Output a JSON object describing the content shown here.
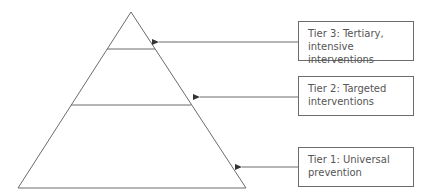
{
  "diagram": {
    "type": "pyramid",
    "line_color": "#6b6b6b",
    "tiers": [
      {
        "id": "tier3",
        "label_line1": "Tier 3: Tertiary,",
        "label_line2": "intensive interventions"
      },
      {
        "id": "tier2",
        "label_line1": "Tier 2: Targeted",
        "label_line2": "interventions"
      },
      {
        "id": "tier1",
        "label_line1": "Tier 1: Universal",
        "label_line2": "prevention"
      }
    ]
  }
}
